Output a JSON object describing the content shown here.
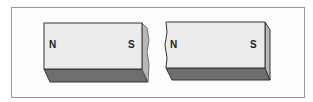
{
  "diagram": {
    "magnets": [
      {
        "id": "left-piece",
        "left_pole": "N",
        "right_pole": "S",
        "broken_edge": "right"
      },
      {
        "id": "right-piece",
        "left_pole": "N",
        "right_pole": "S",
        "broken_edge": "left"
      }
    ],
    "colors": {
      "face": "#ececec",
      "bottom": "#6e6e6e",
      "side": "#b8b8b8",
      "outline": "#333333",
      "frame": "#9a9a9a"
    }
  }
}
